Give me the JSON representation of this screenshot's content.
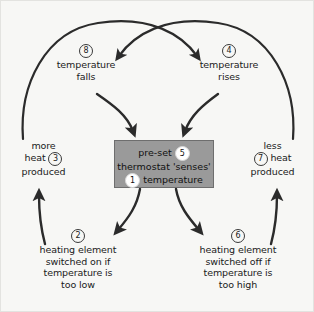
{
  "diagram": {
    "background_color": "#f7f7f5",
    "box_fill_color": "#9a9a9a",
    "line_color": "#2b2b2b",
    "center": {
      "badge_top": "5",
      "badge_bottom": "1",
      "line1": "pre-set",
      "line2": "thermostat 'senses'",
      "line3": "temperature"
    },
    "nodes": [
      {
        "id": "node-8",
        "badge": "8",
        "line1": "temperature",
        "line2": "falls"
      },
      {
        "id": "node-4",
        "badge": "4",
        "line1": "temperature",
        "line2": "rises"
      },
      {
        "id": "node-3",
        "badge": "3",
        "line1": "more",
        "line2": "heat",
        "line3": "produced"
      },
      {
        "id": "node-7",
        "badge": "7",
        "line1": "less",
        "line2": "heat",
        "line3": "produced"
      },
      {
        "id": "node-2",
        "badge": "2",
        "line1": "heating element",
        "line2": "switched on if",
        "line3": "temperature is",
        "line4": "too low"
      },
      {
        "id": "node-6",
        "badge": "6",
        "line1": "heating element",
        "line2": "switched off if",
        "line3": "temperature is",
        "line4": "too high"
      }
    ]
  }
}
